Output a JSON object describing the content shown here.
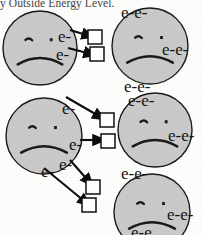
{
  "page": {
    "width": 202,
    "height": 235,
    "background_color": "#fdfdfc"
  },
  "header": {
    "caption": "y Outside Energy Level.",
    "caption_note": "top line cropped at image edge"
  },
  "style": {
    "atom_fill": "#c9c9c9",
    "atom_stroke": "#1a1a1a",
    "face_color": "#1a1a1a",
    "arrow_color": "#0d0d0d",
    "box_fill": "#ffffff",
    "box_stroke": "#101010",
    "text_color": "#141414"
  },
  "legend": {
    "electron_symbol": "e-",
    "electron_pair_symbol": "e-e-",
    "atom_mood": "sad-face",
    "meaning": "atoms with unfilled outer energy level are unhappy; electrons transfer along arrows into acceptor boxes"
  },
  "atoms": [
    {
      "id": "atom-top-left",
      "name": "atom-top-left",
      "cx": 40,
      "cy": 48,
      "r": 37,
      "mood": "sad",
      "electron_labels": [
        "e-",
        "e-",
        "e-"
      ]
    },
    {
      "id": "atom-top-right",
      "name": "atom-top-right",
      "cx": 150,
      "cy": 46,
      "r": 38,
      "mood": "sad",
      "electron_labels": [
        "e-e-",
        "e-e-",
        "e-e-"
      ]
    },
    {
      "id": "atom-middle-left",
      "name": "atom-middle-left",
      "cx": 44,
      "cy": 136,
      "r": 38,
      "mood": "sad",
      "electron_labels": [
        "e-",
        "e-",
        "e-",
        "e-"
      ]
    },
    {
      "id": "atom-middle-right",
      "name": "atom-middle-right",
      "cx": 155,
      "cy": 130,
      "r": 37,
      "mood": "sad",
      "electron_labels": [
        "e-e-",
        "e-e-"
      ]
    },
    {
      "id": "atom-bottom-right",
      "name": "atom-bottom-right",
      "cx": 152,
      "cy": 212,
      "r": 38,
      "mood": "sad",
      "electron_labels": [
        "e-e-",
        "e-e-",
        "e-e-"
      ]
    }
  ],
  "electron_labels": [
    {
      "id": "e-tl-upper",
      "text": "e-",
      "x": 58,
      "y": 28,
      "size": "big"
    },
    {
      "id": "e-tl-mid",
      "text": "e-",
      "x": 56,
      "y": 46,
      "size": "big"
    },
    {
      "id": "e-tr-top",
      "text": "e-e-",
      "x": 121,
      "y": 4,
      "size": "big"
    },
    {
      "id": "e-tr-right",
      "text": "e-e-",
      "x": 162,
      "y": 41,
      "size": "big"
    },
    {
      "id": "e-tr-bottom",
      "text": "e-e-",
      "x": 124,
      "y": 78,
      "size": "big"
    },
    {
      "id": "e-ml-right",
      "text": "e-",
      "x": 62,
      "y": 100,
      "size": "big"
    },
    {
      "id": "e-mr-top",
      "text": "e-e-",
      "x": 128,
      "y": 92,
      "size": "big"
    },
    {
      "id": "e-mr-right",
      "text": "e-e-",
      "x": 168,
      "y": 127,
      "size": "big"
    },
    {
      "id": "e-ml-low",
      "text": "e-",
      "x": 69,
      "y": 136,
      "size": "big"
    },
    {
      "id": "e-bl-pairA",
      "text": "e-",
      "x": 41,
      "y": 163,
      "size": "big"
    },
    {
      "id": "e-bl-pairB",
      "text": "e-",
      "x": 59,
      "y": 156,
      "size": "big"
    },
    {
      "id": "e-br-top",
      "text": "e-e-",
      "x": 121,
      "y": 165,
      "size": "big"
    },
    {
      "id": "e-br-right",
      "text": "e-e-",
      "x": 167,
      "y": 206,
      "size": "big"
    },
    {
      "id": "e-br-bottom",
      "text": "e-e",
      "x": 131,
      "y": 224,
      "size": "big"
    }
  ],
  "acceptor_boxes": [
    {
      "id": "box-1",
      "name": "acceptor-box-top-1",
      "x": 88,
      "y": 30,
      "w": 14,
      "h": 14
    },
    {
      "id": "box-2",
      "name": "acceptor-box-top-2",
      "x": 90,
      "y": 47,
      "w": 14,
      "h": 14
    },
    {
      "id": "box-3",
      "name": "acceptor-box-mid-1",
      "x": 100,
      "y": 113,
      "w": 14,
      "h": 14
    },
    {
      "id": "box-4",
      "name": "acceptor-box-mid-2",
      "x": 101,
      "y": 134,
      "w": 14,
      "h": 14
    },
    {
      "id": "box-5",
      "name": "acceptor-box-bottom-1",
      "x": 86,
      "y": 180,
      "w": 14,
      "h": 14
    },
    {
      "id": "box-6",
      "name": "acceptor-box-bottom-2",
      "x": 82,
      "y": 198,
      "w": 14,
      "h": 14
    }
  ],
  "transfer_arrows": [
    {
      "id": "arrow-1",
      "from_atom": "atom-top-left",
      "to_box": "box-1",
      "x1": 70,
      "y1": 30,
      "x2": 93,
      "y2": 37
    },
    {
      "id": "arrow-2",
      "from_atom": "atom-top-left",
      "to_box": "box-2",
      "x1": 68,
      "y1": 48,
      "x2": 95,
      "y2": 55
    },
    {
      "id": "arrow-3",
      "from_atom": "atom-top-left",
      "to_box": "box-3",
      "x1": 66,
      "y1": 97,
      "x2": 104,
      "y2": 119
    },
    {
      "id": "arrow-4",
      "from_atom": "atom-middle-left",
      "to_box": "box-4",
      "x1": 80,
      "y1": 140,
      "x2": 104,
      "y2": 140
    },
    {
      "id": "arrow-5",
      "from_atom": "atom-middle-left",
      "to_box": "box-5",
      "x1": 70,
      "y1": 160,
      "x2": 92,
      "y2": 185
    },
    {
      "id": "arrow-6",
      "from_atom": "atom-middle-left",
      "to_box": "box-6",
      "x1": 44,
      "y1": 168,
      "x2": 89,
      "y2": 205
    }
  ]
}
